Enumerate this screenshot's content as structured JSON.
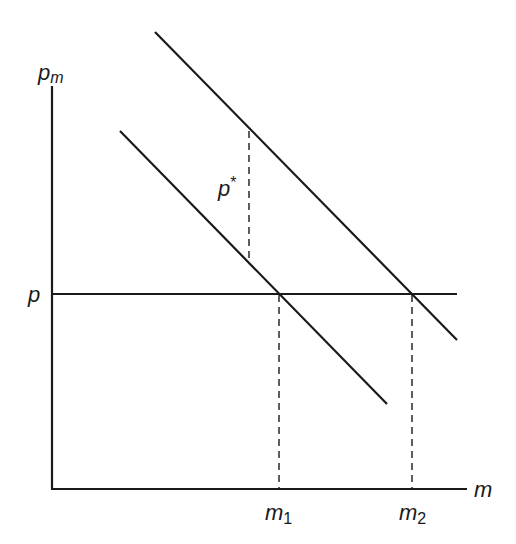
{
  "diagram": {
    "width": 516,
    "height": 544,
    "colors": {
      "line": "#1a1a1a",
      "background": "#ffffff"
    },
    "axes": {
      "y_label_main": "p",
      "y_label_sub": "m",
      "x_label": "m",
      "origin": [
        52,
        489
      ],
      "y_top": 86,
      "x_right": 467
    },
    "price_line": {
      "label": "p",
      "y": 294,
      "x1": 52,
      "x2": 457
    },
    "demand_curves": [
      {
        "name": "lower-demand-curve",
        "x1": 120,
        "y1": 131,
        "x2": 387,
        "y2": 404
      },
      {
        "name": "upper-demand-curve",
        "x1": 155,
        "y1": 32,
        "x2": 457,
        "y2": 340
      }
    ],
    "wedge": {
      "label": "p*",
      "label_main": "p",
      "label_sup": "*",
      "x": 249,
      "y1": 131,
      "y2": 263
    },
    "quantity_markers": [
      {
        "label_main": "m",
        "label_sub": "1",
        "x": 279
      },
      {
        "label_main": "m",
        "label_sub": "2",
        "x": 412
      }
    ]
  }
}
